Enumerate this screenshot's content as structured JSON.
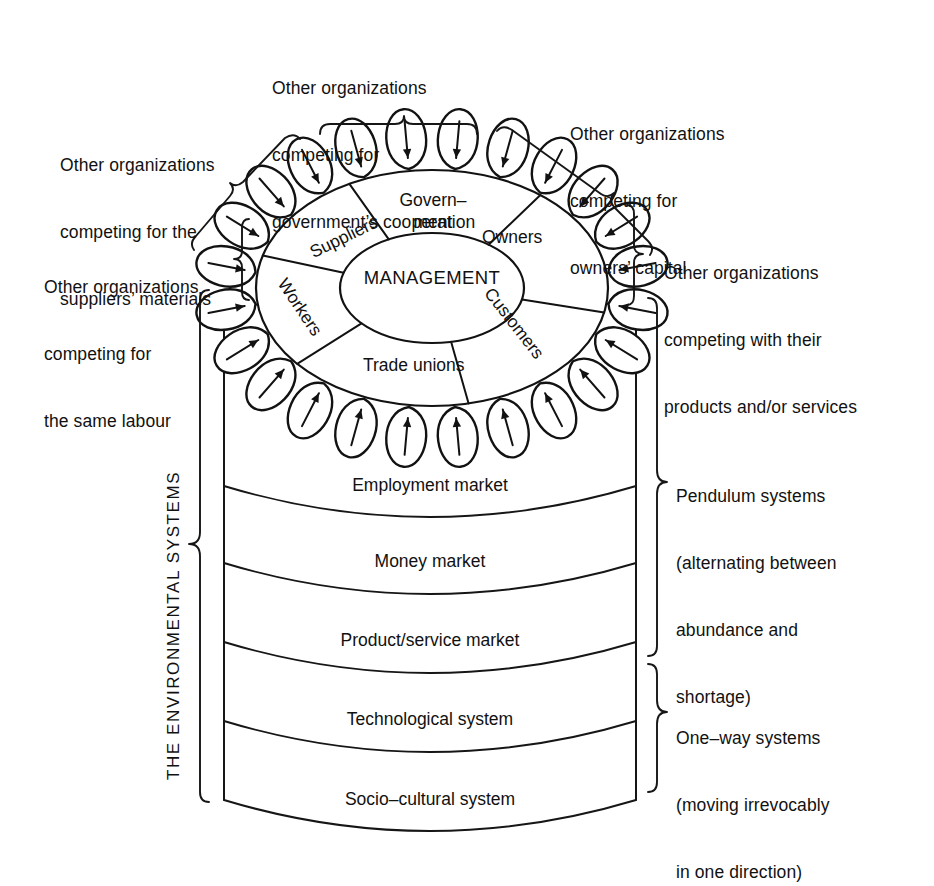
{
  "diagram": {
    "center_label": "MANAGEMENT",
    "vertical_axis_label": "THE ENVIRONMENTAL SYSTEMS",
    "stakeholders": [
      {
        "id": "government",
        "label": "Government",
        "label_line1": "Govern–",
        "label_line2": "ment"
      },
      {
        "id": "owners",
        "label": "Owners"
      },
      {
        "id": "customers",
        "label": "Customers"
      },
      {
        "id": "trade-unions",
        "label": "Trade unions"
      },
      {
        "id": "workers",
        "label": "Workers"
      },
      {
        "id": "suppliers",
        "label": "Suppliers"
      }
    ],
    "callouts": [
      {
        "id": "suppliers-materials",
        "lines": [
          "Other organizations",
          "competing for the",
          "suppliers’ materials"
        ]
      },
      {
        "id": "government-cooperation",
        "lines": [
          "Other organizations",
          "competing for",
          "government’s cooperation"
        ]
      },
      {
        "id": "owners-capital",
        "lines": [
          "Other organizations",
          "competing for",
          "owners’ capital"
        ]
      },
      {
        "id": "products-services",
        "lines": [
          "Other organizations",
          "competing with their",
          "products and/or services"
        ]
      },
      {
        "id": "same-labour",
        "lines": [
          "Other organizations",
          "competing for",
          "the same labour"
        ]
      },
      {
        "id": "pendulum-systems",
        "lines": [
          "Pendulum systems",
          "(alternating between",
          "abundance and",
          "shortage)"
        ]
      },
      {
        "id": "one-way-systems",
        "lines": [
          "One–way systems",
          "(moving irrevocably",
          "in one direction)"
        ]
      }
    ],
    "layers": [
      {
        "id": "employment-market",
        "label": "Employment market",
        "group": "pendulum"
      },
      {
        "id": "money-market",
        "label": "Money market",
        "group": "pendulum"
      },
      {
        "id": "product-service",
        "label": "Product/service market",
        "group": "pendulum"
      },
      {
        "id": "technological",
        "label": "Technological system",
        "group": "one-way"
      },
      {
        "id": "socio-cultural",
        "label": "Socio–cultural system",
        "group": "one-way"
      }
    ],
    "colors": {
      "ink": "#121212",
      "paper": "#ffffff"
    },
    "petal_count": 24
  }
}
